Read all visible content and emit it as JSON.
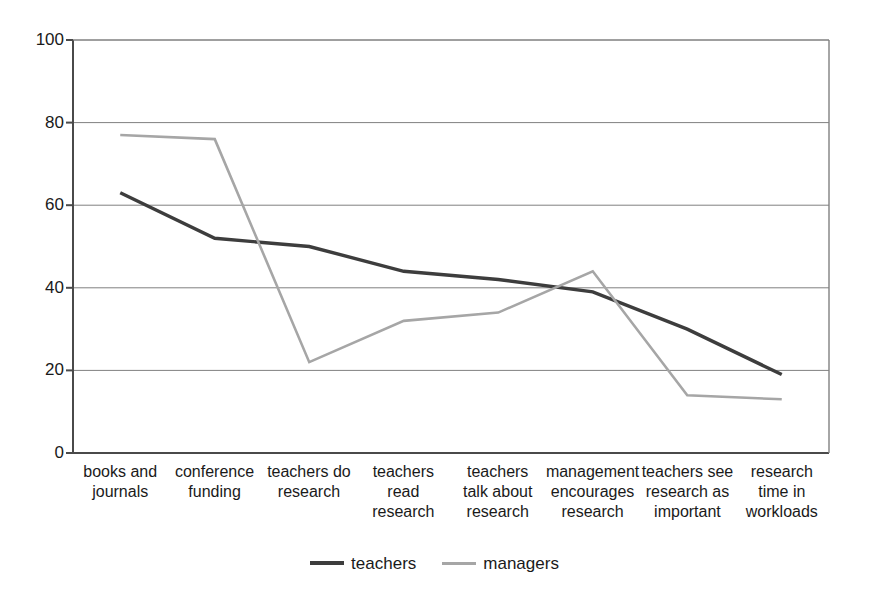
{
  "chart_data": {
    "type": "line",
    "title": "",
    "subtitle": "",
    "xlabel": "",
    "ylabel": "",
    "ylim": [
      0,
      100
    ],
    "yticks": [
      0,
      20,
      40,
      60,
      80,
      100
    ],
    "grid": "horizontal",
    "legend_position": "bottom-center",
    "categories": [
      "books and journals",
      "conference funding",
      "teachers do research",
      "teachers read research",
      "teachers talk about research",
      "management encourages research",
      "teachers see research as important",
      "research time in workloads"
    ],
    "category_lines": [
      [
        "books and",
        "journals"
      ],
      [
        "conference",
        "funding"
      ],
      [
        "teachers do",
        "research"
      ],
      [
        "teachers",
        "read",
        "research"
      ],
      [
        "teachers",
        "talk about",
        "research"
      ],
      [
        "management",
        "encourages",
        "research"
      ],
      [
        "teachers see",
        "research as",
        "important"
      ],
      [
        "research",
        "time in",
        "workloads"
      ]
    ],
    "series": [
      {
        "name": "teachers",
        "color": "#3d3d3d",
        "width": 3.4,
        "values": [
          63,
          52,
          50,
          44,
          42,
          39,
          30,
          19
        ]
      },
      {
        "name": "managers",
        "color": "#a6a6a6",
        "width": 2.6,
        "values": [
          77,
          76,
          22,
          32,
          34,
          44,
          14,
          13
        ]
      }
    ]
  },
  "axes": {
    "y_tick_labels": [
      "100",
      "80",
      "60",
      "40",
      "20",
      "0"
    ]
  },
  "legend": {
    "items": [
      {
        "label": "teachers",
        "style": "teachers"
      },
      {
        "label": "managers",
        "style": "managers"
      }
    ]
  },
  "colors": {
    "teachers": "#3d3d3d",
    "managers": "#a6a6a6",
    "axis": "#4a4a4a",
    "grid": "#808080",
    "background": "#ffffff",
    "text": "#1a1a1a"
  },
  "geometry": {
    "plot_left": 73,
    "plot_right": 829,
    "plot_top": 40,
    "plot_bottom": 453
  }
}
